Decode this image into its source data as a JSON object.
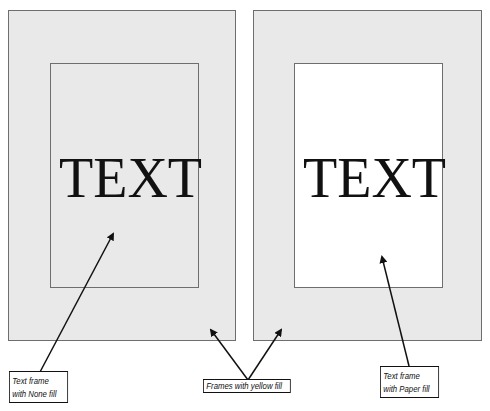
{
  "frames": {
    "left": {
      "outer_fill": "#e9e9e9",
      "inner_fill": "none",
      "text": "TEXT"
    },
    "right": {
      "outer_fill": "#e9e9e9",
      "inner_fill": "#ffffff",
      "text": "TEXT"
    },
    "border_color": "#6e6e6e"
  },
  "callouts": {
    "left": {
      "line1": "Text frame",
      "line2": "with None fill"
    },
    "middle": {
      "line1": "Frames with yellow fill"
    },
    "right": {
      "line1": "Text frame",
      "line2": "with Paper fill"
    }
  },
  "arrow_color": "#111111"
}
